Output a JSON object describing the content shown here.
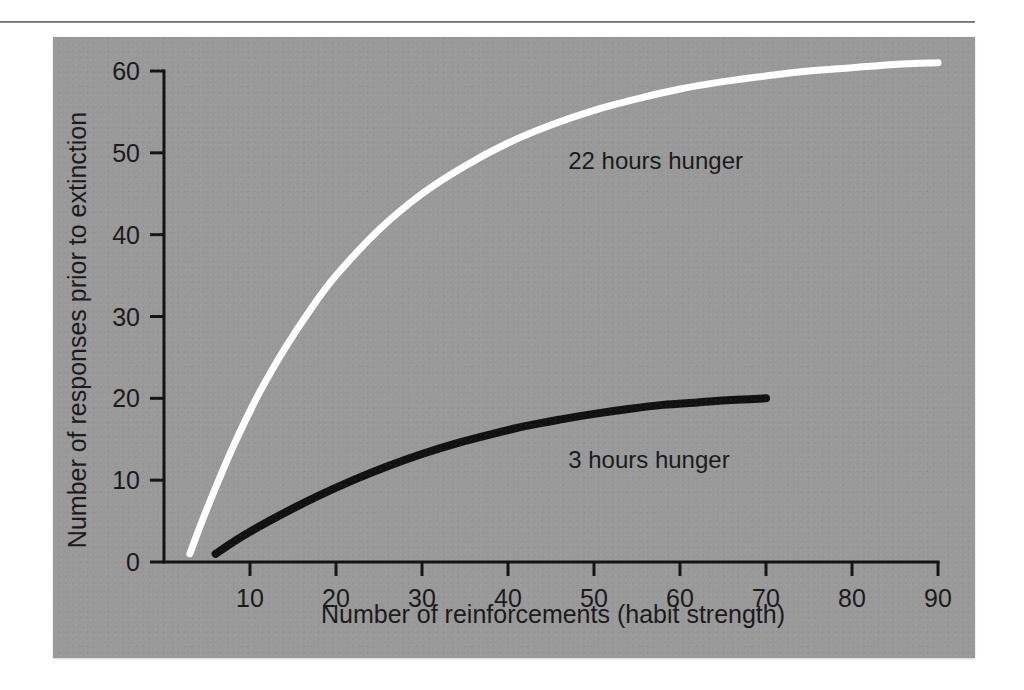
{
  "figure": {
    "panel_background": "#999999",
    "page_background": "#ffffff",
    "rule_color": "#8d8d8d"
  },
  "chart_data": {
    "type": "line",
    "title": "",
    "subtitle": "",
    "xlabel": "Number of reinforcements (habit strength)",
    "ylabel": "Number of responses prior to extinction",
    "xlim": [
      0,
      90
    ],
    "ylim": [
      0,
      62
    ],
    "xticks": [
      10,
      20,
      30,
      40,
      50,
      60,
      70,
      80,
      90
    ],
    "xtick_labels": [
      "10",
      "20",
      "30",
      "40",
      "50",
      "60",
      "70",
      "80",
      "90"
    ],
    "yticks": [
      0,
      10,
      20,
      30,
      40,
      50,
      60
    ],
    "ytick_labels": [
      "0",
      "10",
      "20",
      "30",
      "40",
      "50",
      "60"
    ],
    "grid": false,
    "legend_position": "inline-annotation",
    "series": [
      {
        "name": "22 hours hunger",
        "color": "#ffffff",
        "linewidth": 7,
        "label_x": 47,
        "label_y": 48,
        "x": [
          3,
          5,
          8,
          11,
          14,
          17,
          20,
          25,
          30,
          35,
          40,
          45,
          50,
          55,
          60,
          65,
          70,
          75,
          80,
          85,
          90
        ],
        "y": [
          1.0,
          6.5,
          14.0,
          20.5,
          26.0,
          30.8,
          35.0,
          40.6,
          45.0,
          48.4,
          51.2,
          53.4,
          55.2,
          56.6,
          57.8,
          58.7,
          59.4,
          60.0,
          60.4,
          60.8,
          61.0
        ]
      },
      {
        "name": "3 hours hunger",
        "color": "#111111",
        "linewidth": 8,
        "label_x": 47,
        "label_y": 11.5,
        "x": [
          6,
          8,
          10,
          14,
          18,
          22,
          26,
          30,
          34,
          38,
          42,
          46,
          50,
          54,
          58,
          62,
          66,
          70
        ],
        "y": [
          1.0,
          2.4,
          3.7,
          6.0,
          8.1,
          10.0,
          11.7,
          13.2,
          14.5,
          15.6,
          16.6,
          17.4,
          18.1,
          18.7,
          19.2,
          19.5,
          19.8,
          20.0
        ]
      }
    ]
  },
  "annotations": [
    {
      "id": "series-label-22h",
      "text": "22 hours hunger"
    },
    {
      "id": "series-label-3h",
      "text": "3 hours hunger"
    }
  ]
}
